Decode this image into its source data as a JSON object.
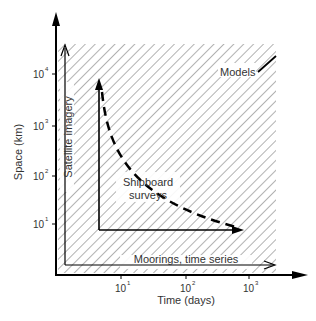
{
  "diagram": {
    "y_axis": {
      "label": "Space (km)",
      "ticks": [
        {
          "base": "10",
          "exp": "1"
        },
        {
          "base": "10",
          "exp": "2"
        },
        {
          "base": "10",
          "exp": "3"
        },
        {
          "base": "10",
          "exp": "4"
        }
      ]
    },
    "x_axis": {
      "label": "Time (days)",
      "ticks": [
        {
          "base": "10",
          "exp": "1"
        },
        {
          "base": "10",
          "exp": "2"
        },
        {
          "base": "10",
          "exp": "3"
        }
      ]
    },
    "regions": {
      "models": "Models",
      "satellite": "Satellite imagery",
      "shipboard_line1": "Shipboard",
      "shipboard_line2": "surveys",
      "moorings": "Moorings, time series"
    },
    "colors": {
      "axis": "#000000",
      "hatch": "#555555",
      "text": "#333333"
    }
  }
}
